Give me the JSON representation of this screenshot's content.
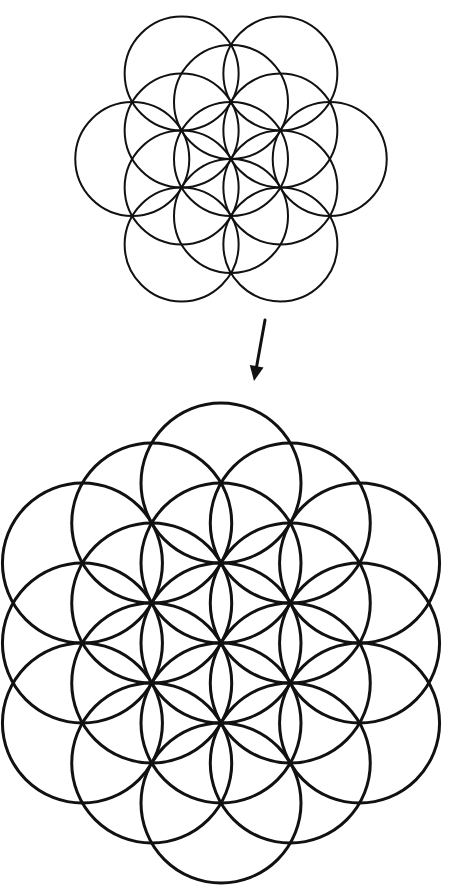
{
  "diagram": {
    "title": "",
    "background": "#ffffff",
    "stroke_color": "#111111",
    "top_figure": {
      "name": "seed-of-life-13",
      "center": [
        231,
        159
      ],
      "radius": 57,
      "stroke_width": 2,
      "circle_count": 13,
      "lattice_offsets": [
        [
          0,
          0
        ],
        [
          0,
          -1
        ],
        [
          0,
          1
        ],
        [
          -0.866,
          -0.5
        ],
        [
          0.866,
          -0.5
        ],
        [
          -0.866,
          0.5
        ],
        [
          0.866,
          0.5
        ],
        [
          -0.866,
          -1.5
        ],
        [
          0.866,
          -1.5
        ],
        [
          -0.866,
          1.5
        ],
        [
          0.866,
          1.5
        ],
        [
          -1.732,
          0
        ],
        [
          1.732,
          0
        ]
      ]
    },
    "arrow": {
      "from": [
        265,
        320
      ],
      "to": [
        254,
        381
      ],
      "stroke_width": 3
    },
    "bottom_figure": {
      "name": "flower-of-life-19",
      "center": [
        221,
        643
      ],
      "radius": 80,
      "stroke_width": 3,
      "circle_count": 19,
      "lattice_offsets": [
        [
          0,
          0
        ],
        [
          0,
          -1
        ],
        [
          0,
          1
        ],
        [
          -0.866,
          -0.5
        ],
        [
          0.866,
          -0.5
        ],
        [
          -0.866,
          0.5
        ],
        [
          0.866,
          0.5
        ],
        [
          -0.866,
          -1.5
        ],
        [
          0.866,
          -1.5
        ],
        [
          -0.866,
          1.5
        ],
        [
          0.866,
          1.5
        ],
        [
          -1.732,
          0
        ],
        [
          1.732,
          0
        ],
        [
          0,
          -2
        ],
        [
          0,
          2
        ],
        [
          -1.732,
          -1
        ],
        [
          1.732,
          -1
        ],
        [
          -1.732,
          1
        ],
        [
          1.732,
          1
        ]
      ]
    }
  }
}
